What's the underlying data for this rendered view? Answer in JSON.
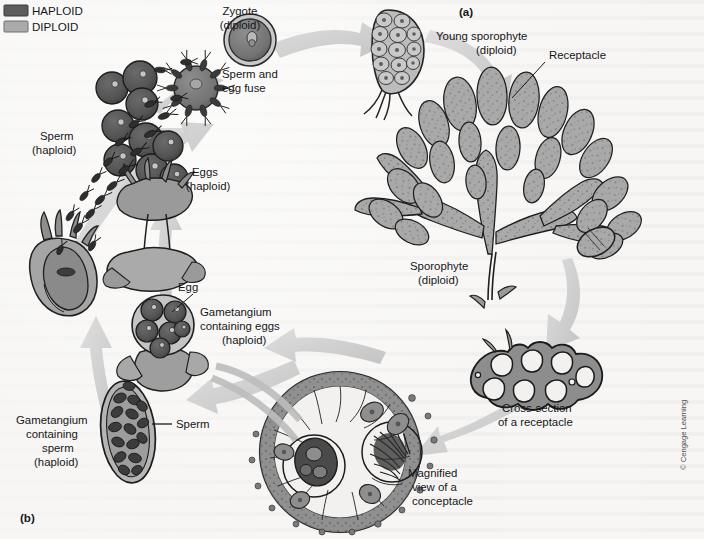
{
  "figure": {
    "panels": [
      {
        "id": "a",
        "label": "(a)"
      },
      {
        "id": "b",
        "label": "(b)"
      }
    ],
    "copyright": "© Cengage Learning"
  },
  "legend": {
    "items": [
      {
        "label": "HAPLOID",
        "color": "#5c5c5c"
      },
      {
        "label": "DIPLOID",
        "color": "#ababab"
      }
    ]
  },
  "labels": {
    "zygote": "Zygote\n(diploid)",
    "zygote_line1": "Zygote",
    "zygote_line2": "(diploid)",
    "sperm_egg_fuse_line1": "Sperm and",
    "sperm_egg_fuse_line2": "egg fuse",
    "young_sporophyte_line1": "Young sporophyte",
    "young_sporophyte_line2": "(diploid)",
    "receptacle": "Receptacle",
    "sporophyte_line1": "Sporophyte",
    "sporophyte_line2": "(diploid)",
    "cross_section_line1": "Cross-section",
    "cross_section_line2": "of a receptacle",
    "magnified_line1": "Magnified",
    "magnified_line2": "view of a",
    "magnified_line3": "conceptacle",
    "sperm_haploid_line1": "Sperm",
    "sperm_haploid_line2": "(haploid)",
    "eggs_haploid_line1": "Eggs",
    "eggs_haploid_line2": "(haploid)",
    "egg": "Egg",
    "gametangium_eggs_line1": "Gametangium",
    "gametangium_eggs_line2": "containing eggs",
    "gametangium_eggs_line3": "(haploid)",
    "gametangium_sperm_line1": "Gametangium",
    "gametangium_sperm_line2": "containing",
    "gametangium_sperm_line3": "sperm",
    "gametangium_sperm_line4": "(haploid)",
    "sperm": "Sperm"
  },
  "colors": {
    "background": "#f7f6f4",
    "haploid_dark": "#5c5c5c",
    "diploid_light": "#ababab",
    "arrow": "#cfcfcf",
    "ink": "#15161a",
    "tissue_mid": "#9a9a9a",
    "tissue_dark": "#6f6f6f"
  }
}
